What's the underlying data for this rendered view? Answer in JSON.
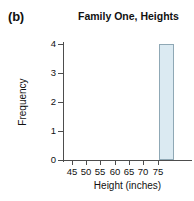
{
  "panel": {
    "label": "(b)"
  },
  "chart_data": {
    "type": "bar",
    "title": "Family One, Heights",
    "xlabel": "Height (inches)",
    "ylabel": "Frequency",
    "xtick_labels": [
      "45",
      "50",
      "55",
      "60",
      "65",
      "70",
      "75"
    ],
    "xtick_values": [
      45,
      50,
      55,
      60,
      65,
      70,
      75
    ],
    "ytick_labels": [
      "0",
      "1",
      "2",
      "3",
      "4"
    ],
    "ytick_values": [
      0,
      1,
      2,
      3,
      4
    ],
    "xlim": [
      42,
      77
    ],
    "ylim": [
      0,
      4
    ],
    "grid": false,
    "legend": null,
    "bin_width": 4,
    "bins": [
      {
        "bin_start": 68,
        "bin_end": 72,
        "value": 4
      }
    ],
    "categories": [
      "68-72"
    ],
    "values": [
      4
    ],
    "bar_fill_color": "#dbeaf2",
    "bar_edge_color": "#8fa8b5",
    "axis_color": "#4d4d4d"
  }
}
